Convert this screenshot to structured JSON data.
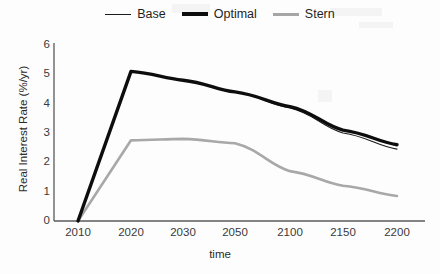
{
  "chart_data": {
    "type": "line",
    "title": "",
    "xlabel": "time",
    "ylabel": "Real Interest Rate (%/yr)",
    "categories": [
      "2010",
      "2020",
      "2030",
      "2050",
      "2100",
      "2150",
      "2200"
    ],
    "x_tick_labels": [
      "2010",
      "2020",
      "2030",
      "2050",
      "2100",
      "2150",
      "2200"
    ],
    "y_tick_labels": [
      "0",
      "1",
      "2",
      "3",
      "4",
      "5",
      "6"
    ],
    "ylim": [
      0,
      6
    ],
    "grid": false,
    "legend_position": "top-center",
    "series": [
      {
        "name": "Base",
        "color": "#1c1c1c",
        "style": "thin",
        "values": [
          0.0,
          5.1,
          4.8,
          4.4,
          3.85,
          3.0,
          2.45
        ]
      },
      {
        "name": "Optimal",
        "color": "#0d0d0d",
        "style": "thick",
        "values": [
          0.0,
          5.1,
          4.8,
          4.4,
          3.9,
          3.1,
          2.6
        ]
      },
      {
        "name": "Stern",
        "color": "#a8a8a8",
        "style": "medium-gray",
        "values": [
          0.0,
          2.75,
          2.8,
          2.65,
          1.7,
          1.2,
          0.85
        ]
      }
    ]
  },
  "legend": {
    "items": [
      {
        "label": "Base"
      },
      {
        "label": "Optimal"
      },
      {
        "label": "Stern"
      }
    ]
  },
  "axes": {
    "y_title": "Real Interest Rate (%/yr)",
    "x_title": "time"
  }
}
